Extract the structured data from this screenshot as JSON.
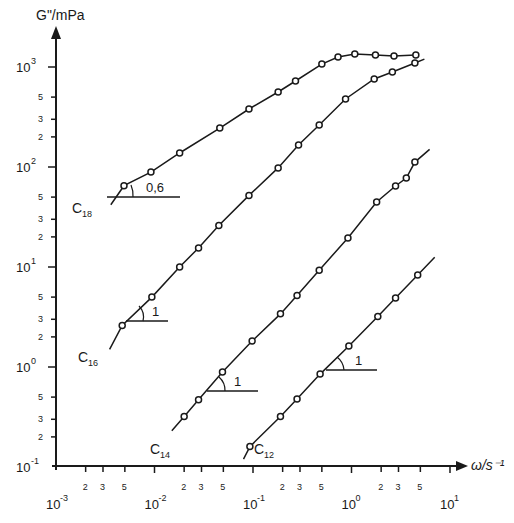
{
  "chart_data": {
    "type": "line",
    "title": "",
    "xlabel": "ω/s⁻¹",
    "ylabel": "G\"/mPa",
    "xscale": "log",
    "yscale": "log",
    "xlim": [
      0.001,
      10
    ],
    "ylim": [
      0.1,
      1000
    ],
    "grid": false,
    "legend": "inline curve labels",
    "x_ticks": {
      "major": [
        {
          "mant": "10",
          "exp": "-3",
          "value": 0.001
        },
        {
          "mant": "10",
          "exp": "-2",
          "value": 0.01
        },
        {
          "mant": "10",
          "exp": "-1",
          "value": 0.1
        },
        {
          "mant": "10",
          "exp": "0",
          "value": 1
        },
        {
          "mant": "10",
          "exp": "1",
          "value": 10
        }
      ],
      "minor_labels": [
        "2",
        "3",
        "5"
      ]
    },
    "y_ticks": {
      "major": [
        {
          "mant": "10",
          "exp": "-1",
          "value": 0.1
        },
        {
          "mant": "10",
          "exp": "0",
          "value": 1
        },
        {
          "mant": "10",
          "exp": "1",
          "value": 10
        },
        {
          "mant": "10",
          "exp": "2",
          "value": 100
        },
        {
          "mant": "10",
          "exp": "3",
          "value": 1000
        }
      ],
      "minor_labels": [
        "2",
        "3",
        "5"
      ]
    },
    "series": [
      {
        "name": "C18",
        "label_main": "C",
        "label_sub": "18",
        "x": [
          0.0049,
          0.0092,
          0.018,
          0.046,
          0.091,
          0.18,
          0.27,
          0.5,
          0.73,
          1.08,
          1.75,
          2.7,
          4.5
        ],
        "y": [
          65,
          89,
          138,
          245,
          380,
          562,
          724,
          1070,
          1260,
          1350,
          1320,
          1290,
          1320
        ],
        "line_start": [
          0.0036,
          42
        ],
        "line_end": [
          4.6,
          1320
        ],
        "slope_annotation": {
          "text": "0,6",
          "slope": 0.6
        }
      },
      {
        "name": "C16",
        "label_main": "C",
        "label_sub": "16",
        "x": [
          0.0047,
          0.0094,
          0.018,
          0.028,
          0.045,
          0.091,
          0.18,
          0.29,
          0.47,
          0.87,
          1.7,
          2.6,
          4.4
        ],
        "y": [
          2.6,
          5.0,
          10,
          15.5,
          26,
          52,
          98,
          166,
          263,
          479,
          759,
          891,
          1096
        ],
        "line_start": [
          0.0035,
          1.5
        ],
        "line_end": [
          5.5,
          1200
        ],
        "slope_annotation": {
          "text": "1",
          "slope": 1
        }
      },
      {
        "name": "C14",
        "label_main": "C",
        "label_sub": "14",
        "x": [
          0.02,
          0.028,
          0.049,
          0.098,
          0.19,
          0.28,
          0.47,
          0.92,
          1.8,
          2.8,
          3.6,
          4.4
        ],
        "y": [
          0.32,
          0.47,
          0.89,
          1.82,
          3.4,
          5.2,
          9.3,
          19.5,
          44.7,
          64.6,
          77.6,
          112
        ],
        "line_start": [
          0.015,
          0.23
        ],
        "line_end": [
          6.2,
          150
        ],
        "slope_annotation": {
          "text": "1",
          "slope": 1
        }
      },
      {
        "name": "C12",
        "label_main": "C",
        "label_sub": "12",
        "x": [
          0.093,
          0.19,
          0.28,
          0.48,
          0.94,
          1.85,
          2.8,
          4.7
        ],
        "y": [
          0.16,
          0.32,
          0.48,
          0.85,
          1.62,
          3.2,
          4.9,
          8.3
        ],
        "line_start": [
          0.08,
          0.12
        ],
        "line_end": [
          7.0,
          12.5
        ],
        "slope_annotation": {
          "text": "1",
          "slope": 1
        }
      }
    ]
  }
}
